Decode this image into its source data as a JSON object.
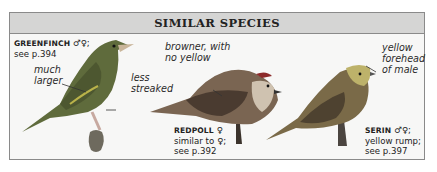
{
  "header": {
    "title": "SIMILAR SPECIES"
  },
  "species": [
    {
      "name": "GREENFINCH",
      "sex": "♂♀;",
      "ref": "see p.394",
      "notes": [
        "much",
        "larger",
        "less",
        "streaked"
      ]
    },
    {
      "name": "REDPOLL",
      "sex": "♀",
      "desc": "similar to ♀;",
      "ref": "see p.392",
      "notes": [
        "browner, with",
        "no yellow"
      ]
    },
    {
      "name": "SERIN",
      "sex": "♂♀;",
      "desc": "yellow rump;",
      "ref": "see p.397",
      "notes": [
        "yellow",
        "forehead",
        "of male"
      ]
    }
  ],
  "colors": {
    "header_bg": "#d5d5d4",
    "border": "#8a8a8a",
    "panel_bg": "#f7f7f6"
  }
}
